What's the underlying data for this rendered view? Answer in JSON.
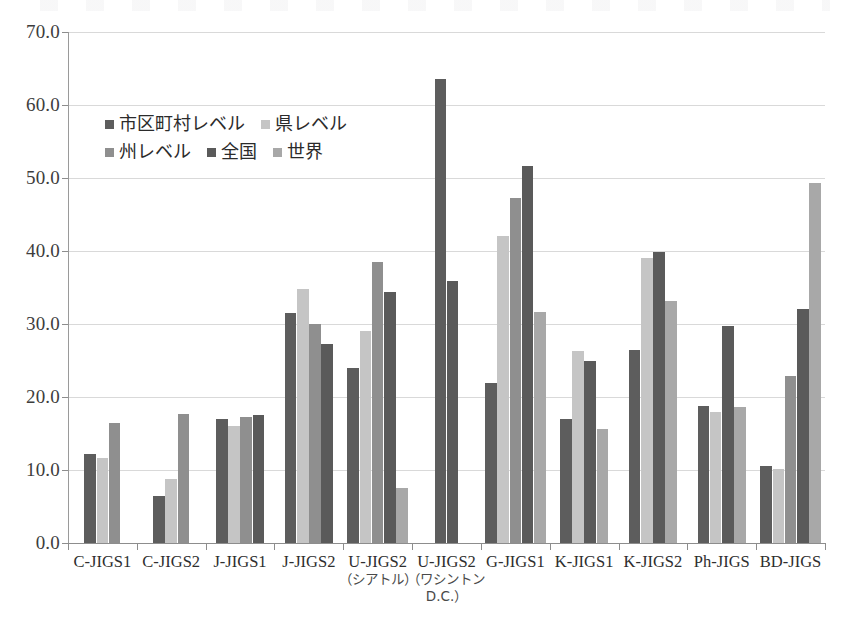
{
  "chart_data": {
    "type": "bar",
    "title": "",
    "subtitle": "",
    "xlabel": "",
    "ylabel": "",
    "ylim": [
      0,
      70
    ],
    "ytick_step": 10,
    "yticks": [
      "0.0",
      "10.0",
      "20.0",
      "30.0",
      "40.0",
      "50.0",
      "60.0",
      "70.0"
    ],
    "grid": true,
    "legend_position": "inside-upper-left",
    "categories": [
      "C-JIGS1",
      "C-JIGS2",
      "J-JIGS1",
      "J-JIGS2",
      "U-JIGS2",
      "U-JIGS2",
      "G-JIGS1",
      "K-JIGS1",
      "K-JIGS2",
      "Ph-JIGS",
      "BD-JIGS"
    ],
    "category_sublabels": [
      "",
      "",
      "",
      "",
      "（シアトル）",
      "（ワシントン D.C.）",
      "",
      "",
      "",
      "",
      ""
    ],
    "series": [
      {
        "name": "市区町村レベル",
        "color": "#5d5d5d",
        "values": [
          12.2,
          6.4,
          17.0,
          31.5,
          24.0,
          63.5,
          21.9,
          17.0,
          26.5,
          18.8,
          10.5
        ]
      },
      {
        "name": "県レベル",
        "color": "#c5c5c5",
        "values": [
          11.7,
          8.8,
          16.0,
          34.8,
          29.0,
          null,
          42.0,
          26.3,
          39.1,
          18.0,
          10.1
        ]
      },
      {
        "name": "州レベル",
        "color": "#8f8f8f",
        "values": [
          16.5,
          17.7,
          17.3,
          30.0,
          38.5,
          null,
          47.2,
          null,
          null,
          null,
          22.9
        ]
      },
      {
        "name": "全国",
        "color": "#5a5a5a",
        "values": [
          null,
          null,
          17.6,
          27.3,
          34.4,
          35.9,
          51.7,
          25.0,
          39.8,
          29.7,
          32.1
        ]
      },
      {
        "name": "世界",
        "color": "#a8a8a8",
        "values": [
          null,
          null,
          null,
          null,
          7.6,
          null,
          31.6,
          15.6,
          33.2,
          18.7,
          49.3
        ]
      }
    ]
  },
  "legend": {
    "row1": [
      "市区町村レベル",
      "県レベル"
    ],
    "row2": [
      "州レベル",
      "全国",
      "世界"
    ]
  },
  "colors": {
    "axis": "#8d8d8d",
    "grid": "#d9d9d9",
    "text": "#2e2e2e"
  }
}
